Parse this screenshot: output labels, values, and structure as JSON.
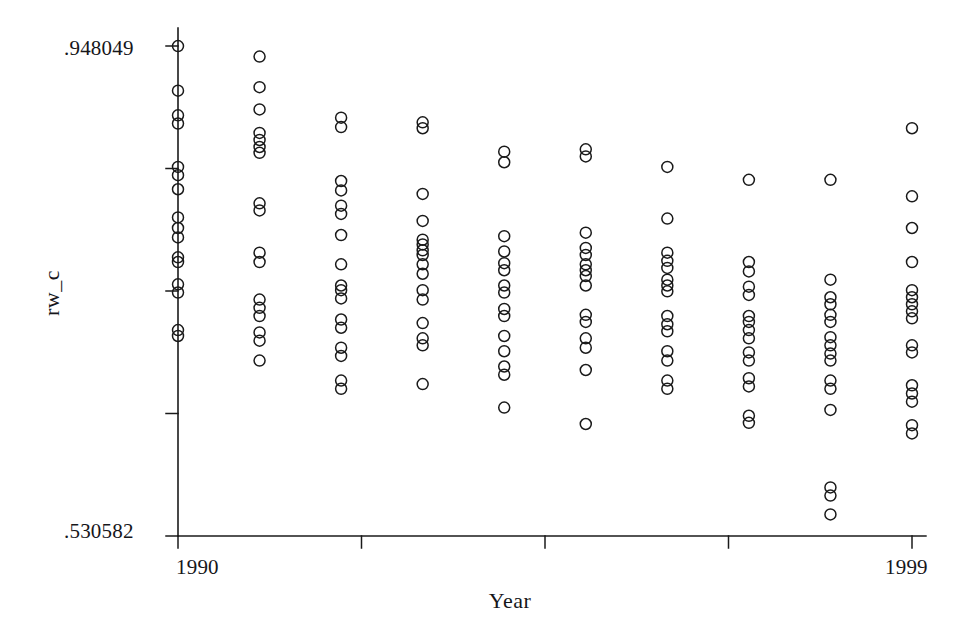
{
  "chart_data": {
    "type": "scatter",
    "title": "",
    "xlabel": "Year",
    "ylabel": "rw_c",
    "xlim": [
      1990,
      1999
    ],
    "ylim": [
      0.530582,
      0.948049
    ],
    "grid": false,
    "legend": null,
    "y_tick_labels": [
      ".948049",
      ".530582"
    ],
    "x_tick_labels": [
      "1990",
      "1999"
    ],
    "y_tick_count": 5,
    "x_tick_count": 5,
    "marker": "open-circle",
    "marker_size": 11,
    "marker_color": "#1a1a1a",
    "series": [
      {
        "name": "rw_c by year",
        "points": [
          {
            "x": 1990,
            "y": 0.948
          },
          {
            "x": 1990,
            "y": 0.91
          },
          {
            "x": 1990,
            "y": 0.889
          },
          {
            "x": 1990,
            "y": 0.882
          },
          {
            "x": 1990,
            "y": 0.845
          },
          {
            "x": 1990,
            "y": 0.838
          },
          {
            "x": 1990,
            "y": 0.826
          },
          {
            "x": 1990,
            "y": 0.802
          },
          {
            "x": 1990,
            "y": 0.793
          },
          {
            "x": 1990,
            "y": 0.785
          },
          {
            "x": 1990,
            "y": 0.768
          },
          {
            "x": 1990,
            "y": 0.764
          },
          {
            "x": 1990,
            "y": 0.745
          },
          {
            "x": 1990,
            "y": 0.738
          },
          {
            "x": 1990,
            "y": 0.706
          },
          {
            "x": 1990,
            "y": 0.701
          }
        ]
      },
      {
        "name": "1991",
        "points": [
          {
            "x": 1991,
            "y": 0.939
          },
          {
            "x": 1991,
            "y": 0.913
          },
          {
            "x": 1991,
            "y": 0.894
          },
          {
            "x": 1991,
            "y": 0.874
          },
          {
            "x": 1991,
            "y": 0.868
          },
          {
            "x": 1991,
            "y": 0.862
          },
          {
            "x": 1991,
            "y": 0.857
          },
          {
            "x": 1991,
            "y": 0.814
          },
          {
            "x": 1991,
            "y": 0.808
          },
          {
            "x": 1991,
            "y": 0.772
          },
          {
            "x": 1991,
            "y": 0.764
          },
          {
            "x": 1991,
            "y": 0.732
          },
          {
            "x": 1991,
            "y": 0.725
          },
          {
            "x": 1991,
            "y": 0.718
          },
          {
            "x": 1991,
            "y": 0.704
          },
          {
            "x": 1991,
            "y": 0.697
          },
          {
            "x": 1991,
            "y": 0.68
          }
        ]
      },
      {
        "name": "1992",
        "points": [
          {
            "x": 1992,
            "y": 0.887
          },
          {
            "x": 1992,
            "y": 0.879
          },
          {
            "x": 1992,
            "y": 0.833
          },
          {
            "x": 1992,
            "y": 0.825
          },
          {
            "x": 1992,
            "y": 0.812
          },
          {
            "x": 1992,
            "y": 0.805
          },
          {
            "x": 1992,
            "y": 0.787
          },
          {
            "x": 1992,
            "y": 0.762
          },
          {
            "x": 1992,
            "y": 0.744
          },
          {
            "x": 1992,
            "y": 0.74
          },
          {
            "x": 1992,
            "y": 0.733
          },
          {
            "x": 1992,
            "y": 0.715
          },
          {
            "x": 1992,
            "y": 0.708
          },
          {
            "x": 1992,
            "y": 0.691
          },
          {
            "x": 1992,
            "y": 0.684
          },
          {
            "x": 1992,
            "y": 0.663
          },
          {
            "x": 1992,
            "y": 0.656
          }
        ]
      },
      {
        "name": "1993",
        "points": [
          {
            "x": 1993,
            "y": 0.883
          },
          {
            "x": 1993,
            "y": 0.878
          },
          {
            "x": 1993,
            "y": 0.822
          },
          {
            "x": 1993,
            "y": 0.799
          },
          {
            "x": 1993,
            "y": 0.783
          },
          {
            "x": 1993,
            "y": 0.779
          },
          {
            "x": 1993,
            "y": 0.774
          },
          {
            "x": 1993,
            "y": 0.77
          },
          {
            "x": 1993,
            "y": 0.762
          },
          {
            "x": 1993,
            "y": 0.754
          },
          {
            "x": 1993,
            "y": 0.74
          },
          {
            "x": 1993,
            "y": 0.732
          },
          {
            "x": 1993,
            "y": 0.712
          },
          {
            "x": 1993,
            "y": 0.699
          },
          {
            "x": 1993,
            "y": 0.693
          },
          {
            "x": 1993,
            "y": 0.66
          }
        ]
      },
      {
        "name": "1994",
        "points": [
          {
            "x": 1994,
            "y": 0.858
          },
          {
            "x": 1994,
            "y": 0.849
          },
          {
            "x": 1994,
            "y": 0.786
          },
          {
            "x": 1994,
            "y": 0.773
          },
          {
            "x": 1994,
            "y": 0.763
          },
          {
            "x": 1994,
            "y": 0.757
          },
          {
            "x": 1994,
            "y": 0.744
          },
          {
            "x": 1994,
            "y": 0.738
          },
          {
            "x": 1994,
            "y": 0.724
          },
          {
            "x": 1994,
            "y": 0.718
          },
          {
            "x": 1994,
            "y": 0.701
          },
          {
            "x": 1994,
            "y": 0.688
          },
          {
            "x": 1994,
            "y": 0.675
          },
          {
            "x": 1994,
            "y": 0.668
          },
          {
            "x": 1994,
            "y": 0.64
          }
        ]
      },
      {
        "name": "1995",
        "points": [
          {
            "x": 1995,
            "y": 0.86
          },
          {
            "x": 1995,
            "y": 0.854
          },
          {
            "x": 1995,
            "y": 0.789
          },
          {
            "x": 1995,
            "y": 0.776
          },
          {
            "x": 1995,
            "y": 0.77
          },
          {
            "x": 1995,
            "y": 0.762
          },
          {
            "x": 1995,
            "y": 0.757
          },
          {
            "x": 1995,
            "y": 0.752
          },
          {
            "x": 1995,
            "y": 0.744
          },
          {
            "x": 1995,
            "y": 0.719
          },
          {
            "x": 1995,
            "y": 0.713
          },
          {
            "x": 1995,
            "y": 0.699
          },
          {
            "x": 1995,
            "y": 0.691
          },
          {
            "x": 1995,
            "y": 0.672
          },
          {
            "x": 1995,
            "y": 0.626
          }
        ]
      },
      {
        "name": "1996",
        "points": [
          {
            "x": 1996,
            "y": 0.845
          },
          {
            "x": 1996,
            "y": 0.801
          },
          {
            "x": 1996,
            "y": 0.772
          },
          {
            "x": 1996,
            "y": 0.765
          },
          {
            "x": 1996,
            "y": 0.759
          },
          {
            "x": 1996,
            "y": 0.749
          },
          {
            "x": 1996,
            "y": 0.744
          },
          {
            "x": 1996,
            "y": 0.739
          },
          {
            "x": 1996,
            "y": 0.718
          },
          {
            "x": 1996,
            "y": 0.711
          },
          {
            "x": 1996,
            "y": 0.705
          },
          {
            "x": 1996,
            "y": 0.688
          },
          {
            "x": 1996,
            "y": 0.68
          },
          {
            "x": 1996,
            "y": 0.663
          },
          {
            "x": 1996,
            "y": 0.656
          }
        ]
      },
      {
        "name": "1997",
        "points": [
          {
            "x": 1997,
            "y": 0.834
          },
          {
            "x": 1997,
            "y": 0.764
          },
          {
            "x": 1997,
            "y": 0.756
          },
          {
            "x": 1997,
            "y": 0.743
          },
          {
            "x": 1997,
            "y": 0.736
          },
          {
            "x": 1997,
            "y": 0.718
          },
          {
            "x": 1997,
            "y": 0.713
          },
          {
            "x": 1997,
            "y": 0.706
          },
          {
            "x": 1997,
            "y": 0.699
          },
          {
            "x": 1997,
            "y": 0.687
          },
          {
            "x": 1997,
            "y": 0.68
          },
          {
            "x": 1997,
            "y": 0.665
          },
          {
            "x": 1997,
            "y": 0.658
          },
          {
            "x": 1997,
            "y": 0.633
          },
          {
            "x": 1997,
            "y": 0.627
          }
        ]
      },
      {
        "name": "1998",
        "points": [
          {
            "x": 1998,
            "y": 0.834
          },
          {
            "x": 1998,
            "y": 0.749
          },
          {
            "x": 1998,
            "y": 0.734
          },
          {
            "x": 1998,
            "y": 0.728
          },
          {
            "x": 1998,
            "y": 0.719
          },
          {
            "x": 1998,
            "y": 0.713
          },
          {
            "x": 1998,
            "y": 0.7
          },
          {
            "x": 1998,
            "y": 0.693
          },
          {
            "x": 1998,
            "y": 0.686
          },
          {
            "x": 1998,
            "y": 0.68
          },
          {
            "x": 1998,
            "y": 0.663
          },
          {
            "x": 1998,
            "y": 0.656
          },
          {
            "x": 1998,
            "y": 0.638
          },
          {
            "x": 1998,
            "y": 0.572
          },
          {
            "x": 1998,
            "y": 0.565
          },
          {
            "x": 1998,
            "y": 0.549
          }
        ]
      },
      {
        "name": "1999",
        "points": [
          {
            "x": 1999,
            "y": 0.878
          },
          {
            "x": 1999,
            "y": 0.82
          },
          {
            "x": 1999,
            "y": 0.793
          },
          {
            "x": 1999,
            "y": 0.764
          },
          {
            "x": 1999,
            "y": 0.74
          },
          {
            "x": 1999,
            "y": 0.734
          },
          {
            "x": 1999,
            "y": 0.728
          },
          {
            "x": 1999,
            "y": 0.722
          },
          {
            "x": 1999,
            "y": 0.716
          },
          {
            "x": 1999,
            "y": 0.693
          },
          {
            "x": 1999,
            "y": 0.687
          },
          {
            "x": 1999,
            "y": 0.659
          },
          {
            "x": 1999,
            "y": 0.652
          },
          {
            "x": 1999,
            "y": 0.645
          },
          {
            "x": 1999,
            "y": 0.625
          },
          {
            "x": 1999,
            "y": 0.618
          }
        ]
      }
    ]
  },
  "axes": {
    "y_top_label": ".948049",
    "y_bottom_label": ".530582",
    "x_left_label": "1990",
    "x_right_label": "1999",
    "y_title": "rw_c",
    "x_title": "Year"
  },
  "colors": {
    "axis": "#1a1a1a",
    "marker": "#1a1a1a",
    "background": "#ffffff"
  }
}
